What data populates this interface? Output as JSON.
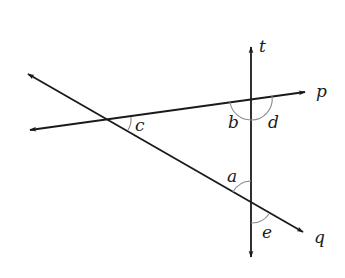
{
  "diagram": {
    "colors": {
      "line": "#1a1a1a",
      "arc": "#8a8a8a",
      "background": "#ffffff"
    },
    "lines": [
      {
        "name": "t",
        "x1": 251,
        "y1": 47,
        "x2": 251,
        "y2": 257
      },
      {
        "name": "p",
        "x1": 30,
        "y1": 130,
        "x2": 305,
        "y2": 92
      },
      {
        "name": "q",
        "x1": 28,
        "y1": 74,
        "x2": 303,
        "y2": 232
      }
    ],
    "intersections": {
      "pq": {
        "x": 110,
        "y": 120
      },
      "tp": {
        "x": 251,
        "y": 99
      },
      "tq": {
        "x": 251,
        "y": 202
      }
    },
    "line_labels": {
      "t": "t",
      "p": "p",
      "q": "q"
    },
    "angle_labels": {
      "a": "a",
      "b": "b",
      "c": "c",
      "d": "d",
      "e": "e"
    }
  }
}
